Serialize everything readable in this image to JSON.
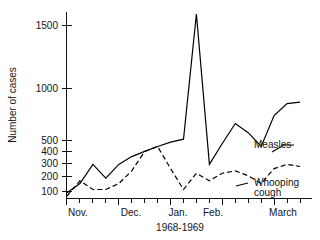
{
  "chart_data": {
    "type": "line",
    "title": "",
    "xlabel": "1968-1969",
    "ylabel": "Number of cases",
    "yscale": "log",
    "ylim": [
      80,
      1900
    ],
    "grid": false,
    "legend_position": "inline-right",
    "ytick_labels": [
      "1500",
      "1000",
      "500",
      "400",
      "300",
      "200",
      "100"
    ],
    "ytick_values": [
      1500,
      1000,
      500,
      400,
      300,
      200,
      100
    ],
    "xtick_labels": [
      "Nov.",
      "Dec.",
      "Jan.",
      "Feb.",
      "March"
    ],
    "x_weeks": 20,
    "annotations": [
      "Measles",
      "Whooping cough"
    ],
    "series": [
      {
        "name": "Measles",
        "style": "solid",
        "x": [
          0,
          1,
          2,
          3,
          4,
          5,
          6,
          7,
          8,
          9,
          10,
          11,
          12,
          13,
          14,
          15,
          16,
          17,
          18
        ],
        "values": [
          95,
          110,
          150,
          120,
          150,
          170,
          185,
          200,
          215,
          225,
          1700,
          150,
          210,
          290,
          250,
          200,
          330,
          400,
          410
        ]
      },
      {
        "name": "Whooping cough",
        "style": "dashed",
        "x": [
          0,
          1,
          2,
          3,
          4,
          5,
          6,
          7,
          8,
          9,
          10,
          11,
          12,
          13,
          14,
          15,
          16,
          17,
          18
        ],
        "values": [
          90,
          115,
          100,
          100,
          110,
          135,
          185,
          200,
          140,
          100,
          130,
          115,
          130,
          135,
          125,
          110,
          140,
          150,
          145
        ]
      }
    ]
  },
  "labels": {
    "y_axis_title": "Number of cases",
    "x_period": "1968-1969",
    "measles": "Measles",
    "whooping": "Whooping",
    "cough": "cough",
    "y_1500": "1500",
    "y_1000": "1000",
    "y_500": "500",
    "y_400": "400",
    "y_300": "300",
    "y_200": "200",
    "y_100": "100",
    "m_nov": "Nov.",
    "m_dec": "Dec.",
    "m_jan": "Jan.",
    "m_feb": "Feb.",
    "m_mar": "March"
  }
}
